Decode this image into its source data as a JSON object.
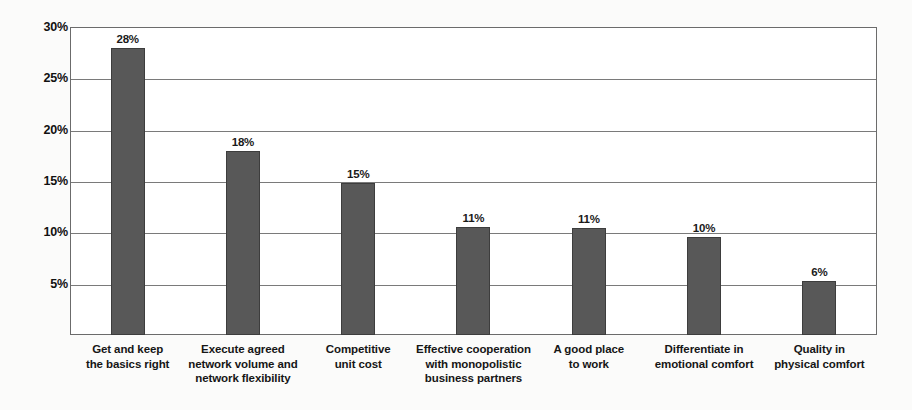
{
  "chart_data": {
    "type": "bar",
    "title": "",
    "xlabel": "",
    "ylabel": "",
    "ylim": [
      0,
      30
    ],
    "y_ticks": [
      "5%",
      "10%",
      "15%",
      "20%",
      "25%",
      "30%"
    ],
    "y_tick_values": [
      5,
      10,
      15,
      20,
      25,
      30
    ],
    "grid": true,
    "legend": "none",
    "orientation": "vertical",
    "categories": [
      "Get and keep\nthe basics right",
      "Execute agreed\nnetwork volume and\nnetwork flexibility",
      "Competitive\nunit cost",
      "Effective cooperation\nwith monopolistic\nbusiness partners",
      "A good place\nto work",
      "Differentiate in\nemotional comfort",
      "Quality in\nphysical comfort"
    ],
    "category_lines": [
      [
        "Get and keep",
        "the basics right"
      ],
      [
        "Execute agreed",
        "network volume and",
        "network flexibility"
      ],
      [
        "Competitive",
        "unit cost"
      ],
      [
        "Effective cooperation",
        "with monopolistic",
        "business partners"
      ],
      [
        "A good place",
        "to work"
      ],
      [
        "Differentiate in",
        "emotional comfort"
      ],
      [
        "Quality in",
        "physical comfort"
      ]
    ],
    "values": [
      28,
      18,
      15,
      11,
      11,
      10,
      6
    ],
    "plotted_values": [
      28.0,
      17.9,
      14.8,
      10.5,
      10.4,
      9.5,
      5.3
    ],
    "data_labels": [
      "28%",
      "18%",
      "15%",
      "11%",
      "11%",
      "10%",
      "6%"
    ],
    "colors": {
      "bar_fill": "#585858",
      "bar_border": "#3d3d3d",
      "gridline": "#7a7a7a",
      "frame": "#6b6b6b",
      "plot_background": "#ffffff",
      "page_background": "#fbfbfa",
      "text": "#161616"
    }
  }
}
